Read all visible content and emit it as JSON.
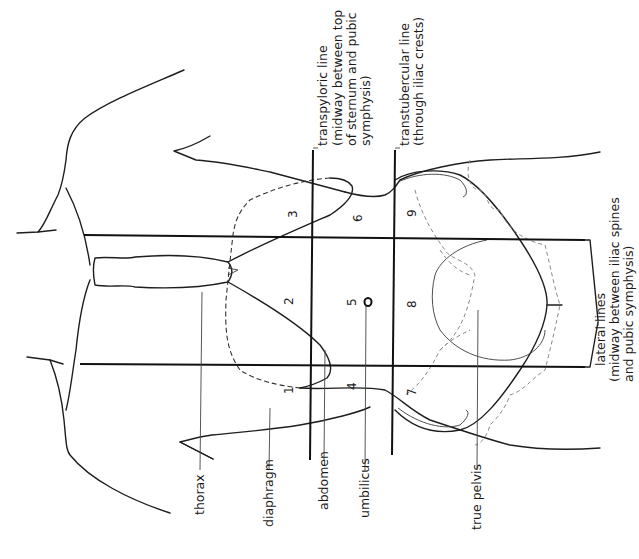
{
  "figure": {
    "orientation": "rotated 90° clockwise (head at left, pelvis at right)",
    "labels": {
      "thorax": "thorax",
      "diaphragm": "diaphragm",
      "abdomen": "abdomen",
      "umbilicus": "umbilicus",
      "true_pelvis": "true pelvis",
      "transpyloric_1": "transpyloric line",
      "transpyloric_2": "(midway between top",
      "transpyloric_3": "of sternum and pubic",
      "transpyloric_4": "symphysis)",
      "transtubercular_1": "transtubercular line",
      "transtubercular_2": "(through iliac crests)",
      "lateral_1": "lateral lines",
      "lateral_2": "(midway between iliac spines",
      "lateral_3": "and pubic symphysis)"
    },
    "regions": [
      {
        "id": "1",
        "label": "1"
      },
      {
        "id": "2",
        "label": "2"
      },
      {
        "id": "3",
        "label": "3"
      },
      {
        "id": "4",
        "label": "4"
      },
      {
        "id": "5",
        "label": "5"
      },
      {
        "id": "6",
        "label": "6"
      },
      {
        "id": "7",
        "label": "7"
      },
      {
        "id": "8",
        "label": "8"
      },
      {
        "id": "9",
        "label": "9"
      }
    ]
  }
}
